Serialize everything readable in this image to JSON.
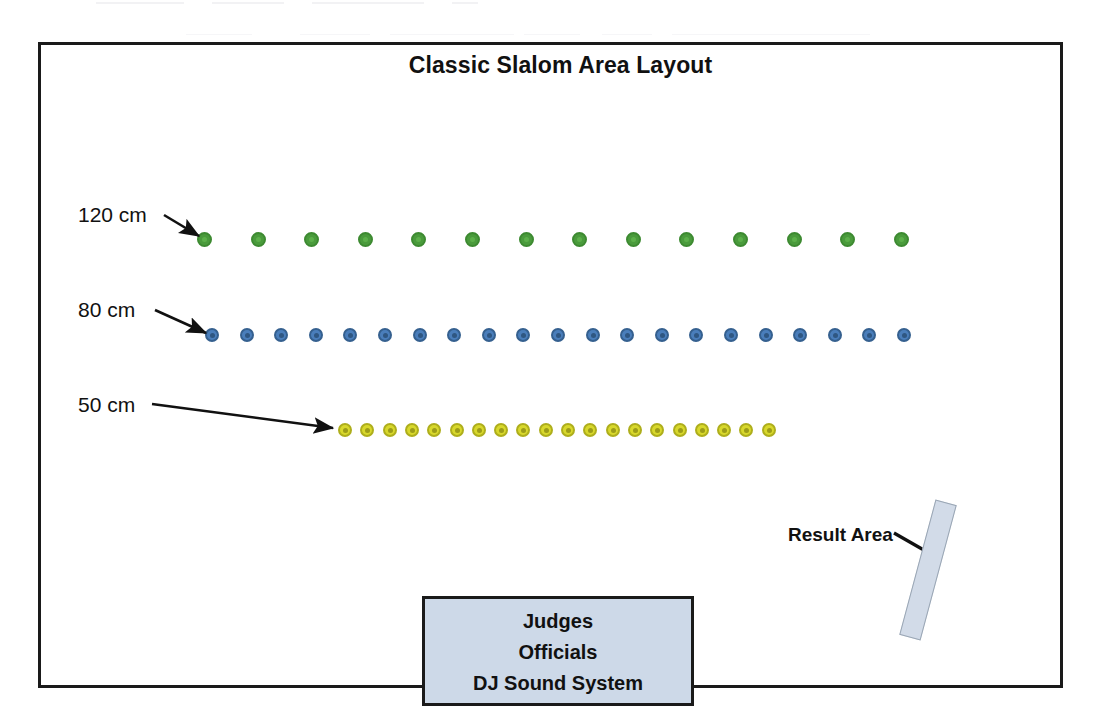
{
  "title": "Classic Slalom Area Layout",
  "frame": {
    "name": "court-frame"
  },
  "callouts": [
    {
      "label": "120 cm",
      "x": 78,
      "y": 203,
      "arrow": {
        "x1": 164,
        "y1": 215,
        "x2": 199,
        "y2": 236
      }
    },
    {
      "label": "80 cm",
      "x": 78,
      "y": 298,
      "arrow": {
        "x1": 155,
        "y1": 310,
        "x2": 206,
        "y2": 333
      }
    },
    {
      "label": "50 cm",
      "x": 78,
      "y": 393,
      "arrow": {
        "x1": 152,
        "y1": 404,
        "x2": 333,
        "y2": 428
      }
    }
  ],
  "cone_rows": [
    {
      "name": "green-cone-row",
      "color_label": "green",
      "spacing_label": "120 cm",
      "count": 14,
      "start_x": 197,
      "step_x": 53.6,
      "y": 232,
      "color": "#4a9b3c"
    },
    {
      "name": "blue-cone-row",
      "color_label": "blue",
      "spacing_label": "80 cm",
      "count": 21,
      "start_x": 205,
      "step_x": 34.6,
      "y": 328,
      "color": "#4a7ebb"
    },
    {
      "name": "yellow-cone-row",
      "color_label": "yellow",
      "spacing_label": "50 cm",
      "count": 20,
      "start_x": 338,
      "step_x": 22.3,
      "y": 423,
      "color": "#d8d82c"
    }
  ],
  "judges_box": {
    "lines": [
      "Judges",
      "Officials",
      "DJ Sound System"
    ],
    "fill": "#cdd9e8"
  },
  "result_area": {
    "label": "Result Area",
    "leader": {
      "x1": 894,
      "y1": 533,
      "x2": 929,
      "y2": 553
    },
    "fill": "#d2dbe8"
  },
  "scan_artifacts": [
    {
      "x": 96,
      "width": 88
    },
    {
      "x": 212,
      "width": 72
    },
    {
      "x": 312,
      "width": 112
    },
    {
      "x": 452,
      "width": 26
    },
    {
      "x": 186,
      "width": 66,
      "row": 2
    },
    {
      "x": 300,
      "width": 70,
      "row": 2
    },
    {
      "x": 390,
      "width": 124,
      "row": 2
    },
    {
      "x": 524,
      "width": 56,
      "row": 2
    },
    {
      "x": 602,
      "width": 50,
      "row": 2
    },
    {
      "x": 672,
      "width": 198,
      "row": 2
    }
  ]
}
